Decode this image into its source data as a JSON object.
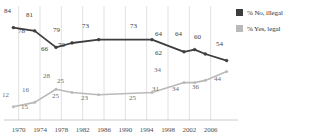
{
  "chart_data": {
    "type": "line",
    "title": "",
    "xlabel": "",
    "ylabel": "",
    "xlim": [
      1968,
      2010
    ],
    "ylim": [
      0,
      100
    ],
    "grid": "vertical",
    "legend_position": "right",
    "x_ticks": [
      "1970",
      "1974",
      "1978",
      "1982",
      "1986",
      "1990",
      "1994",
      "1998",
      "2002",
      "2006"
    ],
    "x_tick_values": [
      1970,
      1974,
      1978,
      1982,
      1986,
      1990,
      1994,
      1998,
      2002,
      2006
    ],
    "series": [
      {
        "name": "% No, illegal",
        "color": "#3d3d3d",
        "x": [
          1969,
          1973,
          1977,
          1980,
          1985,
          1995,
          2001,
          2003,
          2005,
          2009
        ],
        "values": [
          84,
          81,
          66,
          70,
          73,
          73,
          62,
          64,
          60,
          54
        ],
        "labels": [
          "84",
          "81",
          "66",
          "70",
          "73",
          "73",
          "62",
          "64",
          "60",
          "54"
        ],
        "label_positions": [
          "above",
          "above",
          "below",
          "below",
          "above",
          "above",
          "below",
          "above",
          "above",
          "above"
        ]
      },
      {
        "name": "% Yes, legal",
        "color": "#b9b9b9",
        "x": [
          1969,
          1973,
          1977,
          1980,
          1985,
          1995,
          2001,
          2003,
          2005,
          2009
        ],
        "values": [
          12,
          16,
          28,
          25,
          23,
          25,
          34,
          34,
          36,
          44
        ],
        "labels": [
          "12",
          "16",
          "28",
          "25",
          "23",
          "25",
          "34",
          "34",
          "36",
          "44"
        ],
        "label_positions": [
          "above",
          "above",
          "above",
          "above",
          "below",
          "below",
          "above",
          "below",
          "below",
          "above"
        ]
      }
    ],
    "extra_labels": [
      {
        "text": "78",
        "series": "% No, illegal",
        "note": "between 84 and 81 descent"
      },
      {
        "text": "15",
        "series": "% Yes, legal",
        "note": "between 12 and 16 ascent"
      },
      {
        "text": "25",
        "series": "% Yes, legal",
        "note": "below 28 peak"
      },
      {
        "text": "70",
        "series": "% No, illegal",
        "note": "below midline"
      },
      {
        "text": "31",
        "series": "% Yes, legal",
        "note": "rise toward 34"
      },
      {
        "text": "64",
        "series": "% No, illegal",
        "note": "upper plateau"
      }
    ]
  },
  "legend": {
    "items": [
      {
        "label": "% No, illegal",
        "color": "#3d3d3d"
      },
      {
        "label": "% Yes, legal",
        "color": "#b9b9b9"
      }
    ]
  },
  "axis": {
    "ticks": [
      {
        "label": "1970"
      },
      {
        "label": "1974"
      },
      {
        "label": "1978"
      },
      {
        "label": "1982"
      },
      {
        "label": "1986"
      },
      {
        "label": "1990"
      },
      {
        "label": "1994"
      },
      {
        "label": "1998"
      },
      {
        "label": "2002"
      },
      {
        "label": "2006"
      }
    ]
  },
  "data_labels": {
    "dark": [
      {
        "t": "84",
        "x": 4,
        "y": 8
      },
      {
        "t": "81",
        "x": 26,
        "y": 12
      },
      {
        "t": "78",
        "x": 18,
        "y": 28
      },
      {
        "t": "66",
        "x": 41,
        "y": 46
      },
      {
        "t": "70",
        "x": 58,
        "y": 42
      },
      {
        "t": "79",
        "x": 53,
        "y": 27
      },
      {
        "t": "73",
        "x": 82,
        "y": 23
      },
      {
        "t": "73",
        "x": 130,
        "y": 23
      },
      {
        "t": "64",
        "x": 155,
        "y": 31
      },
      {
        "t": "62",
        "x": 155,
        "y": 50
      },
      {
        "t": "64",
        "x": 175,
        "y": 31
      },
      {
        "t": "60",
        "x": 194,
        "y": 34
      },
      {
        "t": "54",
        "x": 216,
        "y": 41
      }
    ],
    "light": [
      {
        "t": "12",
        "x": 2,
        "y": 92
      },
      {
        "t": "16",
        "x": 22,
        "y": 87
      },
      {
        "t": "15",
        "x": 21,
        "y": 104
      },
      {
        "t": "28",
        "x": 43,
        "y": 73
      },
      {
        "t": "25",
        "x": 57,
        "y": 78
      },
      {
        "t": "25",
        "x": 52,
        "y": 93
      },
      {
        "t": "23",
        "x": 81,
        "y": 95
      },
      {
        "t": "25",
        "x": 129,
        "y": 95
      },
      {
        "t": "34",
        "x": 154,
        "y": 67
      },
      {
        "t": "31",
        "x": 152,
        "y": 86
      },
      {
        "t": "34",
        "x": 172,
        "y": 86
      },
      {
        "t": "36",
        "x": 192,
        "y": 84
      },
      {
        "t": "44",
        "x": 214,
        "y": 76
      }
    ]
  }
}
